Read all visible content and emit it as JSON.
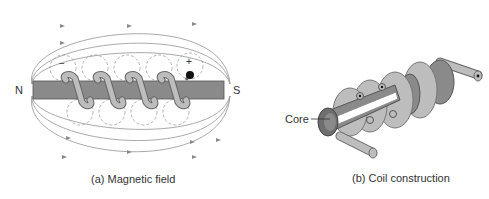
{
  "figure_a": {
    "caption": "(a) Magnetic field",
    "north_label": "N",
    "south_label": "S",
    "minus_sign": "−",
    "plus_sign": "+"
  },
  "figure_b": {
    "caption": "(b) Coil construction",
    "core_label": "Core"
  },
  "colors": {
    "core_fill": "#8a8a8a",
    "coil_fill": "#b8b8b8",
    "field_line": "#9a9a9a",
    "dark_core": "#6e6e6e"
  }
}
